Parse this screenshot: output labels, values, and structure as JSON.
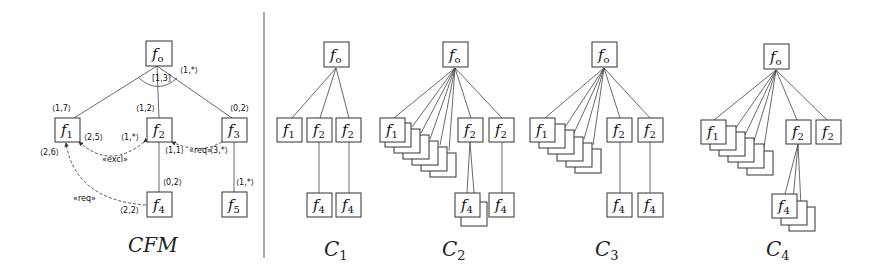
{
  "cfm": {
    "title": "CFM",
    "root": {
      "label": "f",
      "sub": "o"
    },
    "group_cardinality": "[1,3]",
    "root_card": "⟨1,*⟩",
    "features": [
      {
        "id": "f1",
        "label": "f",
        "sub": "1",
        "card": "⟨1,7⟩"
      },
      {
        "id": "f2",
        "label": "f",
        "sub": "2",
        "card": "⟨1,2⟩"
      },
      {
        "id": "f3",
        "label": "f",
        "sub": "3",
        "card": "⟨0,2⟩"
      },
      {
        "id": "f4",
        "label": "f",
        "sub": "4",
        "card": "⟨0,2⟩"
      },
      {
        "id": "f5",
        "label": "f",
        "sub": "5",
        "card": "⟨1,*⟩"
      }
    ],
    "constraints": [
      {
        "type": "«excl»",
        "from": "f1",
        "to": "f2",
        "from_card": "⟨2,5⟩",
        "to_card": "⟨1,*⟩"
      },
      {
        "type": "«req»",
        "from": "f3",
        "to": "f2",
        "from_card": "⟨3,*⟩",
        "to_card": "⟨1,1⟩"
      },
      {
        "type": "«req»",
        "from": "f4",
        "to": "f1",
        "from_card": "⟨2,2⟩",
        "to_card": "⟨2,6⟩"
      }
    ]
  },
  "configs": [
    {
      "title": "C",
      "sub": "1"
    },
    {
      "title": "C",
      "sub": "2"
    },
    {
      "title": "C",
      "sub": "3"
    },
    {
      "title": "C",
      "sub": "4"
    }
  ],
  "labels": {
    "fo": "f",
    "fo_sub": "o",
    "f1": "f",
    "f1_sub": "1",
    "f2": "f",
    "f2_sub": "2",
    "f4": "f",
    "f4_sub": "4"
  }
}
